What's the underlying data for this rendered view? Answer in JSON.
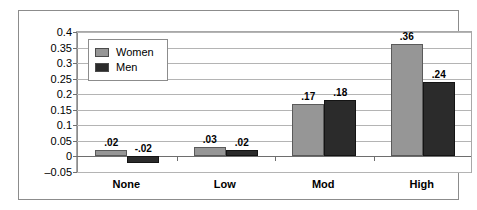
{
  "chart_data": {
    "type": "bar",
    "title": "",
    "subtitle": "",
    "xlabel": "",
    "ylabel": "",
    "categories": [
      "None",
      "Low",
      "Mod",
      "High"
    ],
    "series": [
      {
        "name": "Women",
        "color": "#969696",
        "values": [
          0.02,
          0.03,
          0.17,
          0.36
        ],
        "labels": [
          ".02",
          ".03",
          ".17",
          ".36"
        ]
      },
      {
        "name": "Men",
        "color": "#2b2b2b",
        "values": [
          -0.02,
          0.02,
          0.18,
          0.24
        ],
        "labels": [
          "-.02",
          ".02",
          ".18",
          ".24"
        ]
      }
    ],
    "ylim": [
      -0.05,
      0.4
    ],
    "ytick_values": [
      0.4,
      0.35,
      0.3,
      0.25,
      0.2,
      0.15,
      0.1,
      0.05,
      0,
      -0.05
    ],
    "ytick_labels": [
      "0.4",
      "0.35",
      "0.3",
      "0.25",
      "0.2",
      "0.15",
      "0.1",
      "0.05",
      "0",
      "–0.05"
    ],
    "grid": true,
    "legend_position": "inside-top-left",
    "legend_entries": [
      "Women",
      "Men"
    ]
  }
}
